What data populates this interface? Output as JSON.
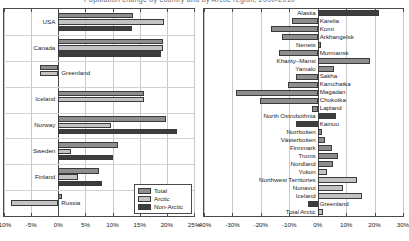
{
  "caption": {
    "text": "Population change by country and by Arctic region, 2000-2010"
  },
  "colors": {
    "total": "#8e8e8e",
    "arctic": "#c3c3c3",
    "non_arctic": "#3d3d3d",
    "axis": "#4a4a4a",
    "grid": "#c9c9c9"
  },
  "legend": {
    "items": [
      {
        "label": "Total",
        "series": "total"
      },
      {
        "label": "Arctic",
        "series": "arctic"
      },
      {
        "label": "Non-Arctic",
        "series": "non_arctic"
      }
    ]
  },
  "chart_data": [
    {
      "id": "left",
      "type": "bar",
      "orientation": "horizontal",
      "title": "",
      "xlabel": "",
      "ylabel": "",
      "xlim": [
        -10,
        25
      ],
      "xticks": [
        -10,
        -5,
        0,
        5,
        10,
        15,
        20,
        25
      ],
      "xtick_labels": [
        "-10%",
        "-5%",
        "0%",
        "5%",
        "10%",
        "15%",
        "20%",
        "25%"
      ],
      "grid": true,
      "legend_position": "lower-right",
      "categories": [
        "USA",
        "Canada",
        "Greenland",
        "Iceland",
        "Norway",
        "Sweden",
        "Finland",
        "Russia"
      ],
      "series": [
        {
          "name": "Total",
          "values": [
            13.8,
            19.3,
            -3.4,
            15.7,
            19.8,
            11.0,
            7.5,
            0.6
          ]
        },
        {
          "name": "Arctic",
          "values": [
            19.4,
            19.3,
            -3.4,
            15.7,
            9.8,
            2.4,
            3.7,
            -8.8
          ]
        },
        {
          "name": "Non-Arctic",
          "values": [
            13.6,
            19.0,
            0.0,
            0.0,
            21.9,
            10.0,
            8.0,
            0.0
          ]
        }
      ]
    },
    {
      "id": "right",
      "type": "bar",
      "orientation": "horizontal",
      "title": "",
      "xlabel": "",
      "ylabel": "",
      "xlim": [
        -40,
        30
      ],
      "xticks": [
        -40,
        -30,
        -20,
        -10,
        0,
        10,
        20,
        30
      ],
      "xtick_labels": [
        "-40%",
        "-30%",
        "-20%",
        "-10%",
        "0%",
        "10%",
        "20%",
        "30%"
      ],
      "grid": true,
      "legend_position": "none",
      "categories": [
        "Alaska",
        "Karelia",
        "Komi",
        "Arkhangelsk",
        "Nenets",
        "Murmansk",
        "Khanty–Mansi",
        "Yamalo",
        "Sakha",
        "Kamchatka",
        "Magadan",
        "Chukotka",
        "Lapland",
        "North Ostrobothnia",
        "Kainuu",
        "Norrbotten",
        "Västerbotten",
        "Finnmark",
        "Troms",
        "Nordland",
        "Yukon",
        "Northwest Territories",
        "Nunavut",
        "Iceland",
        "Greenland",
        "Total Arctic"
      ],
      "series": [
        {
          "name": "Population change",
          "values": [
            21.4,
            -8.9,
            -16.6,
            -12.4,
            1.2,
            -13.5,
            18.4,
            5.8,
            -7.6,
            -10.5,
            -28.8,
            -20.3,
            -2.0,
            6.3,
            -7.6,
            1.6,
            2.7,
            5.2,
            7.0,
            5.5,
            3.3,
            13.8,
            8.8,
            15.7,
            -3.4,
            2.0
          ]
        }
      ],
      "bar_styles": [
        "non_arctic",
        "total",
        "total",
        "total",
        "total",
        "total",
        "total",
        "total",
        "total",
        "total",
        "total",
        "total",
        "total",
        "non_arctic",
        "non_arctic",
        "total",
        "total",
        "total",
        "total",
        "total",
        "arctic",
        "arctic",
        "arctic",
        "arctic",
        "non_arctic",
        "arctic"
      ]
    }
  ]
}
